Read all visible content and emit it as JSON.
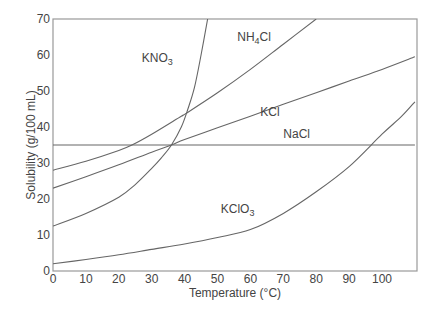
{
  "chart_data": {
    "type": "line",
    "title": "",
    "xlabel": "Temperature (°C)",
    "ylabel": "Solubility (g/100 mL)",
    "xlim": [
      0,
      110
    ],
    "ylim": [
      0,
      70
    ],
    "x_ticks": [
      0,
      10,
      20,
      30,
      40,
      50,
      60,
      70,
      80,
      90,
      100
    ],
    "y_ticks": [
      0,
      10,
      20,
      30,
      40,
      50,
      60,
      70
    ],
    "grid": false,
    "legend": "inline labels on curves",
    "series": [
      {
        "name": "KNO3",
        "label_main": "KNO",
        "label_sub": "3",
        "label_pos": [
          27,
          58
        ],
        "points": [
          [
            0,
            12.5
          ],
          [
            10,
            16
          ],
          [
            20,
            20.5
          ],
          [
            25,
            24
          ],
          [
            30,
            28.5
          ],
          [
            33,
            31.5
          ],
          [
            36,
            35
          ],
          [
            39,
            40
          ],
          [
            41,
            45
          ],
          [
            43,
            51
          ],
          [
            45,
            60
          ],
          [
            47,
            70
          ]
        ]
      },
      {
        "name": "NH4Cl",
        "label_main": "NH",
        "label_sub": "4",
        "label_tail": "Cl",
        "label_pos": [
          56,
          64
        ],
        "points": [
          [
            0,
            28
          ],
          [
            10,
            30.5
          ],
          [
            20,
            33.5
          ],
          [
            24,
            35
          ],
          [
            30,
            38
          ],
          [
            39,
            43
          ],
          [
            40,
            43.5
          ],
          [
            50,
            49.5
          ],
          [
            60,
            56
          ],
          [
            70,
            63
          ],
          [
            80,
            70
          ]
        ]
      },
      {
        "name": "KCl",
        "label_main": "KCl",
        "label_pos": [
          63,
          43
        ],
        "points": [
          [
            0,
            23
          ],
          [
            10,
            26.2
          ],
          [
            20,
            29.5
          ],
          [
            30,
            33
          ],
          [
            36,
            35
          ],
          [
            40,
            36.5
          ],
          [
            50,
            39.8
          ],
          [
            60,
            43
          ],
          [
            70,
            46.3
          ],
          [
            80,
            49.5
          ],
          [
            90,
            52.8
          ],
          [
            100,
            56
          ],
          [
            110,
            59.5
          ]
        ]
      },
      {
        "name": "NaCl",
        "label_main": "NaCl",
        "label_pos": [
          70,
          37
        ],
        "points": [
          [
            0,
            35
          ],
          [
            110,
            35
          ]
        ]
      },
      {
        "name": "KClO3",
        "label_main": "KClO",
        "label_sub": "3",
        "label_pos": [
          51,
          16
        ],
        "points": [
          [
            0,
            2
          ],
          [
            10,
            3.2
          ],
          [
            20,
            4.5
          ],
          [
            30,
            6
          ],
          [
            40,
            7.5
          ],
          [
            50,
            9.3
          ],
          [
            60,
            11.5
          ],
          [
            70,
            16
          ],
          [
            80,
            22
          ],
          [
            90,
            29
          ],
          [
            100,
            38
          ],
          [
            106,
            43
          ],
          [
            110,
            47
          ]
        ]
      }
    ],
    "colors": {
      "line": "#666666",
      "axis": "#999999",
      "text": "#444444"
    }
  }
}
